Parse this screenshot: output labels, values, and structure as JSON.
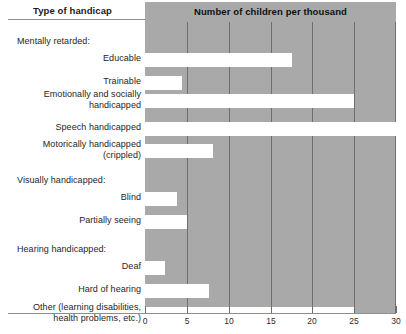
{
  "header": {
    "left_title": "Type of handicap",
    "right_title": "Number of children per thousand"
  },
  "chart_data": {
    "type": "bar",
    "orientation": "horizontal",
    "title": "Number of children per thousand",
    "xlabel": "Number of children per thousand",
    "ylabel": "Type of handicap",
    "xlim": [
      0,
      30
    ],
    "xticks": [
      0,
      5,
      10,
      15,
      20,
      25,
      30
    ],
    "xticklabels": [
      "0",
      "5",
      "10",
      "15",
      "20",
      "25",
      "30"
    ],
    "grid": true,
    "legend": false,
    "bar_color": "#ffffff",
    "panel_color": "#a9a9a9",
    "categories": [
      "Educable",
      "Trainable",
      "Emotionally and socially\nhandicapped",
      "Speech handicapped",
      "Motorically handicapped\n(crippled)",
      "Blind",
      "Partially seeing",
      "Deaf",
      "Hard of hearing",
      "Other (learning disabilities,\nhealth problems, etc.)"
    ],
    "values": [
      17.6,
      4.4,
      25.0,
      30.0,
      8.1,
      3.8,
      5.0,
      2.4,
      7.6,
      25.0
    ],
    "group_headings": [
      "Mentally retarded:",
      "Visually handicapped:",
      "Hearing handicapped:"
    ]
  },
  "rows": [
    {
      "kind": "group",
      "label": "Mentally retarded:",
      "top": 14
    },
    {
      "kind": "bar",
      "label": "Educable",
      "value": 17.6,
      "top": 31
    },
    {
      "kind": "bar",
      "label": "Trainable",
      "value": 4.4,
      "top": 54
    },
    {
      "kind": "bar",
      "label": "Emotionally and socially\nhandicapped",
      "value": 25.0,
      "top": 72
    },
    {
      "kind": "bar",
      "label": "Speech handicapped",
      "value": 30.0,
      "top": 100
    },
    {
      "kind": "bar",
      "label": "Motorically handicapped\n(crippled)",
      "value": 8.1,
      "top": 122
    },
    {
      "kind": "group",
      "label": "Visually handicapped:",
      "top": 153
    },
    {
      "kind": "bar",
      "label": "Blind",
      "value": 3.8,
      "top": 170
    },
    {
      "kind": "bar",
      "label": "Partially seeing",
      "value": 5.0,
      "top": 193
    },
    {
      "kind": "group",
      "label": "Hearing handicapped:",
      "top": 222
    },
    {
      "kind": "bar",
      "label": "Deaf",
      "value": 2.4,
      "top": 239
    },
    {
      "kind": "bar",
      "label": "Hard of hearing",
      "value": 7.6,
      "top": 262
    },
    {
      "kind": "bar",
      "label": "Other (learning disabilities,\nhealth problems, etc.)",
      "value": 25.0,
      "top": 285
    }
  ]
}
